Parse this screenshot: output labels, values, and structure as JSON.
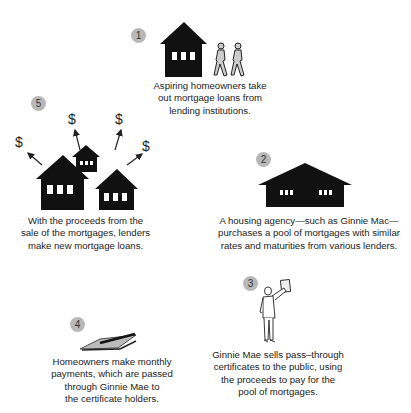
{
  "steps": [
    {
      "number": "1",
      "caption": [
        "Aspiring homeowners take",
        "out mortgage loans from",
        "lending institutions."
      ]
    },
    {
      "number": "2",
      "caption": [
        "A housing agency—such as Ginnie Mac—",
        "purchases a pool of mortgages with similar",
        "rates and maturities from various lenders."
      ]
    },
    {
      "number": "3",
      "caption": [
        "Ginnie Mae sells pass–through",
        "certificates to the public, using",
        "the proceeds to pay for the",
        "pool of mortgages."
      ]
    },
    {
      "number": "4",
      "caption": [
        "Homeowners make monthly",
        "payments, which are passed",
        "through Ginnie Mae to",
        "the certificate holders."
      ]
    },
    {
      "number": "5",
      "caption": [
        "With the proceeds from the",
        "sale of the mortgages, lenders",
        "make new mortgage loans."
      ],
      "symbols": [
        "$",
        "$",
        "$",
        "$"
      ]
    }
  ],
  "colors": {
    "badge": "#b8b8b8",
    "ink": "#111111"
  }
}
